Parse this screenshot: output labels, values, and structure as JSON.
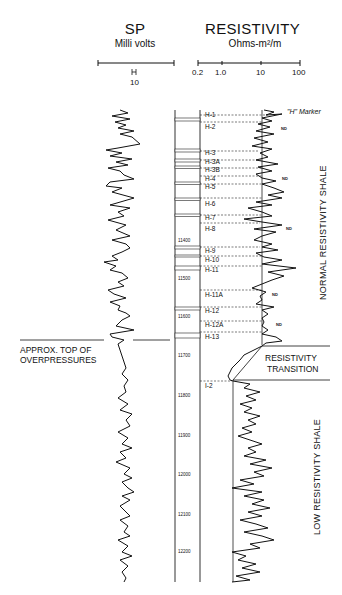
{
  "sp": {
    "title": "SP",
    "unit": "Milli volts",
    "scale_label": "10"
  },
  "resistivity": {
    "title": "RESISTIVITY",
    "unit": "Ohms-m²/m",
    "scale_ticks": [
      "0.2",
      "1.0",
      "10",
      "100"
    ]
  },
  "depths": [
    "11400",
    "11500",
    "11600",
    "11700",
    "11800",
    "11900",
    "12000",
    "12100",
    "12200"
  ],
  "markers": [
    "H-1",
    "H-2",
    "H-3",
    "H-3A",
    "H-3B",
    "H-4",
    "H-5",
    "H-6",
    "H-7",
    "H-8",
    "H-9",
    "H-10",
    "H-11",
    "H-11A",
    "H-12",
    "H-12A",
    "H-13",
    "I-2"
  ],
  "annotations": {
    "h_marker": "\"H\" Marker",
    "nd": "ND",
    "overpressure_line1": "APPROX. TOP OF",
    "overpressure_line2": "OVERPRESSURES",
    "transition_line1": "RESISTIVITY",
    "transition_line2": "TRANSITION",
    "normal_shale": "NORMAL RESISTIVITY SHALE",
    "low_shale": "LOW RESISTIVITY SHALE"
  }
}
